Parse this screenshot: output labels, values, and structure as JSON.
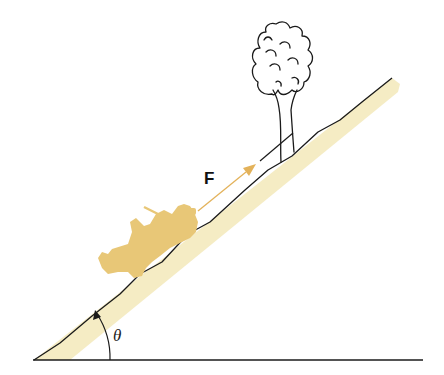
{
  "diagram": {
    "type": "physics-inclined-plane",
    "labels": {
      "force": "F",
      "angle": "θ"
    },
    "elements": [
      {
        "name": "ground-line",
        "description": "horizontal baseline"
      },
      {
        "name": "incline-surface",
        "description": "inclined hill with tan shading below the surface line"
      },
      {
        "name": "vehicle",
        "description": "tan-colored jeep on incline"
      },
      {
        "name": "force-arrow",
        "description": "force vector F along incline, pointing up-slope"
      },
      {
        "name": "cable",
        "description": "line from arrow tip to tree"
      },
      {
        "name": "tree",
        "description": "line-drawn tree standing on slope"
      },
      {
        "name": "angle-arc",
        "description": "arc with arrowhead marking incline angle θ"
      }
    ],
    "colors": {
      "incline_fill": "#f5ecc4",
      "vehicle": "#e8c777",
      "arrow": "#e3b25a",
      "line": "#1a1a1a",
      "background": "#ffffff"
    }
  }
}
